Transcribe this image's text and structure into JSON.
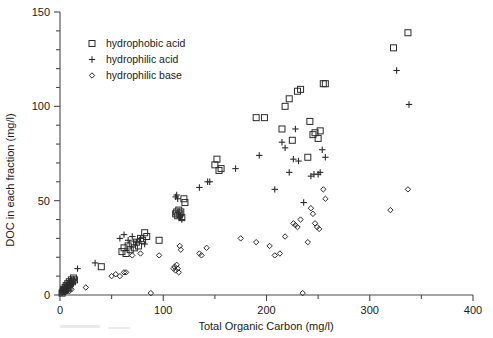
{
  "chart_data": {
    "type": "scatter",
    "title": "",
    "xlabel": "Total Organic Carbon (mg/l)",
    "ylabel": "DOC in each fraction (mg/l)",
    "xlim": [
      0,
      400
    ],
    "ylim": [
      0,
      150
    ],
    "xticks": [
      0,
      100,
      200,
      300,
      400
    ],
    "xtick_labels": [
      "0",
      "100",
      "200",
      "300",
      "400"
    ],
    "xminor_step": 50,
    "yticks": [
      0,
      50,
      100,
      150
    ],
    "ytick_labels": [
      "0",
      "50",
      "100",
      "150"
    ],
    "yminor_step": 10,
    "grid": false,
    "legend_position": "upper-left-inside",
    "series": [
      {
        "name": "hydrophobic acid",
        "marker": "open-square",
        "points": [
          [
            2,
            1
          ],
          [
            3,
            2
          ],
          [
            3.5,
            3
          ],
          [
            4,
            2.5
          ],
          [
            5,
            4
          ],
          [
            5.5,
            3
          ],
          [
            6,
            5
          ],
          [
            7,
            4
          ],
          [
            7.5,
            6
          ],
          [
            8,
            5
          ],
          [
            9,
            7
          ],
          [
            10,
            6
          ],
          [
            11,
            8
          ],
          [
            12,
            7
          ],
          [
            13,
            9
          ],
          [
            14,
            8
          ],
          [
            40,
            15
          ],
          [
            60,
            23
          ],
          [
            62,
            25
          ],
          [
            64,
            22
          ],
          [
            66,
            26
          ],
          [
            68,
            24
          ],
          [
            70,
            27
          ],
          [
            72,
            25
          ],
          [
            74,
            28
          ],
          [
            76,
            26
          ],
          [
            78,
            30
          ],
          [
            80,
            29
          ],
          [
            82,
            33
          ],
          [
            84,
            31
          ],
          [
            96,
            29
          ],
          [
            112,
            43
          ],
          [
            113,
            44
          ],
          [
            114,
            42
          ],
          [
            115,
            45
          ],
          [
            116,
            43
          ],
          [
            117,
            44
          ],
          [
            118,
            41
          ],
          [
            120,
            51
          ],
          [
            121,
            49
          ],
          [
            150,
            69
          ],
          [
            152,
            72
          ],
          [
            154,
            66
          ],
          [
            156,
            67
          ],
          [
            190,
            94
          ],
          [
            198,
            94
          ],
          [
            215,
            88
          ],
          [
            218,
            100
          ],
          [
            222,
            104
          ],
          [
            225,
            82
          ],
          [
            230,
            108
          ],
          [
            233,
            109
          ],
          [
            240,
            73
          ],
          [
            242,
            92
          ],
          [
            245,
            85
          ],
          [
            247,
            86
          ],
          [
            250,
            83
          ],
          [
            252,
            87
          ],
          [
            255,
            112
          ],
          [
            257,
            112
          ],
          [
            323,
            131
          ],
          [
            337,
            139
          ]
        ]
      },
      {
        "name": "hydrophilic acid",
        "marker": "plus",
        "points": [
          [
            2,
            2
          ],
          [
            3,
            3
          ],
          [
            4,
            2
          ],
          [
            5,
            4
          ],
          [
            6,
            3
          ],
          [
            7,
            5
          ],
          [
            8,
            4
          ],
          [
            9,
            6
          ],
          [
            10,
            5
          ],
          [
            11,
            7
          ],
          [
            12,
            6
          ],
          [
            13,
            8
          ],
          [
            17,
            14
          ],
          [
            34,
            17
          ],
          [
            58,
            30
          ],
          [
            62,
            32
          ],
          [
            66,
            29
          ],
          [
            70,
            31
          ],
          [
            74,
            28
          ],
          [
            78,
            30
          ],
          [
            82,
            27
          ],
          [
            112,
            52
          ],
          [
            113,
            53
          ],
          [
            114,
            51
          ],
          [
            116,
            41
          ],
          [
            117,
            42
          ],
          [
            118,
            40
          ],
          [
            135,
            57
          ],
          [
            143,
            60
          ],
          [
            145,
            60
          ],
          [
            170,
            67
          ],
          [
            193,
            74
          ],
          [
            208,
            56
          ],
          [
            215,
            81
          ],
          [
            218,
            78
          ],
          [
            222,
            65
          ],
          [
            226,
            72
          ],
          [
            228,
            88
          ],
          [
            231,
            71
          ],
          [
            236,
            49
          ],
          [
            243,
            63
          ],
          [
            246,
            64
          ],
          [
            250,
            64
          ],
          [
            252,
            65
          ],
          [
            254,
            77
          ],
          [
            257,
            73
          ],
          [
            326,
            119
          ],
          [
            338,
            101
          ]
        ]
      },
      {
        "name": "hydrophilic base",
        "marker": "open-diamond",
        "points": [
          [
            2,
            1
          ],
          [
            3,
            1.5
          ],
          [
            4,
            2
          ],
          [
            5,
            1.5
          ],
          [
            6,
            2.5
          ],
          [
            7,
            2
          ],
          [
            8,
            3
          ],
          [
            9,
            2
          ],
          [
            10,
            3.5
          ],
          [
            11,
            3
          ],
          [
            25,
            4
          ],
          [
            50,
            10
          ],
          [
            54,
            11
          ],
          [
            58,
            10
          ],
          [
            62,
            12
          ],
          [
            64,
            12
          ],
          [
            70,
            21
          ],
          [
            78,
            22
          ],
          [
            88,
            1
          ],
          [
            96,
            21
          ],
          [
            110,
            14
          ],
          [
            111,
            15
          ],
          [
            112,
            13
          ],
          [
            113,
            16
          ],
          [
            114,
            14
          ],
          [
            115,
            12
          ],
          [
            116,
            26
          ],
          [
            117,
            24
          ],
          [
            135,
            22
          ],
          [
            137,
            21
          ],
          [
            142,
            25
          ],
          [
            175,
            30
          ],
          [
            190,
            28
          ],
          [
            203,
            26
          ],
          [
            208,
            21
          ],
          [
            213,
            22
          ],
          [
            218,
            31
          ],
          [
            226,
            38
          ],
          [
            228,
            37
          ],
          [
            230,
            36
          ],
          [
            233,
            40
          ],
          [
            235,
            1
          ],
          [
            240,
            28
          ],
          [
            243,
            46
          ],
          [
            245,
            43
          ],
          [
            247,
            38
          ],
          [
            249,
            36
          ],
          [
            251,
            35
          ],
          [
            255,
            56
          ],
          [
            257,
            51
          ],
          [
            320,
            45
          ],
          [
            337,
            56
          ]
        ]
      }
    ]
  },
  "legend": {
    "items": [
      {
        "label": "hydrophobic acid",
        "marker": "open-square"
      },
      {
        "label": "hydrophilic acid",
        "marker": "plus"
      },
      {
        "label": "hydrophilic base",
        "marker": "open-diamond"
      }
    ]
  },
  "colors": {
    "marker": "#2b2b2b",
    "axis": "#4a4a4a",
    "text": "#1a1a1a",
    "background": "#ffffff"
  }
}
